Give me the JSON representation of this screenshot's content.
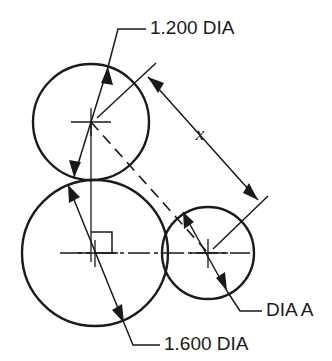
{
  "drawing": {
    "title": "Three tangent circles dimensioned technical drawing",
    "background_color": "#ffffff",
    "line_color": "#1a1a1a",
    "canvas": {
      "width": 332,
      "height": 361
    },
    "labels": {
      "top_dia": "1.200 DIA",
      "bottom_dia": "1.600 DIA",
      "right_dia": "DIA A",
      "distance": "x"
    },
    "circles": [
      {
        "name": "top-left-circle",
        "label": "1.200 DIA",
        "cx": 91,
        "cy": 122,
        "r": 58,
        "diameter_value": "1.200"
      },
      {
        "name": "bottom-left-circle",
        "label": "1.600 DIA",
        "cx": 95,
        "cy": 253,
        "r": 73,
        "diameter_value": "1.600"
      },
      {
        "name": "right-circle",
        "label": "DIA A",
        "cx": 208,
        "cy": 253,
        "r": 46,
        "diameter_value": "A"
      }
    ],
    "dimensions": [
      {
        "name": "x-dimension",
        "label": "x",
        "from": "1.200 DIA circle center",
        "to": "DIA A circle center"
      }
    ],
    "annotations": {
      "right_angle_marker": "90 degree square at bottom-left circle center",
      "center_axis": "horizontal centerline through bottom circles",
      "vertical_axis": "vertical centerline from top circle center"
    }
  }
}
